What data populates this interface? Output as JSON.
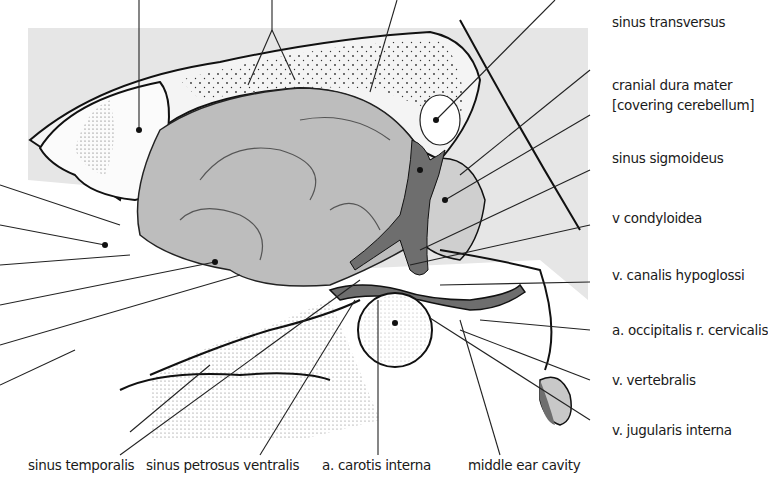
{
  "figure": {
    "type": "anatomical-diagram",
    "colors": {
      "background_panel": "#e6e6e6",
      "brain_fill": "#bdbdbd",
      "dural_sinus_fill": "#6e6e6e",
      "dura_fill": "#f4f4f4",
      "outline": "#111111",
      "leader_line": "#222222",
      "label_text": "#1a1a1a"
    },
    "right_labels": [
      {
        "text": "sinus transversus"
      },
      {
        "text": "cranial dura mater"
      },
      {
        "text": "[covering cerebellum]"
      },
      {
        "text": "sinus sigmoideus"
      },
      {
        "text": "v condyloidea"
      },
      {
        "text": "v. canalis hypoglossi"
      },
      {
        "text": "a. occipitalis r. cervicalis"
      },
      {
        "text": "v. vertebralis"
      },
      {
        "text": "v. jugularis interna"
      }
    ],
    "bottom_labels": [
      {
        "text": "sinus temporalis"
      },
      {
        "text": "sinus petrosus ventralis"
      },
      {
        "text": "a. carotis interna"
      },
      {
        "text": "middle ear cavity"
      }
    ]
  }
}
